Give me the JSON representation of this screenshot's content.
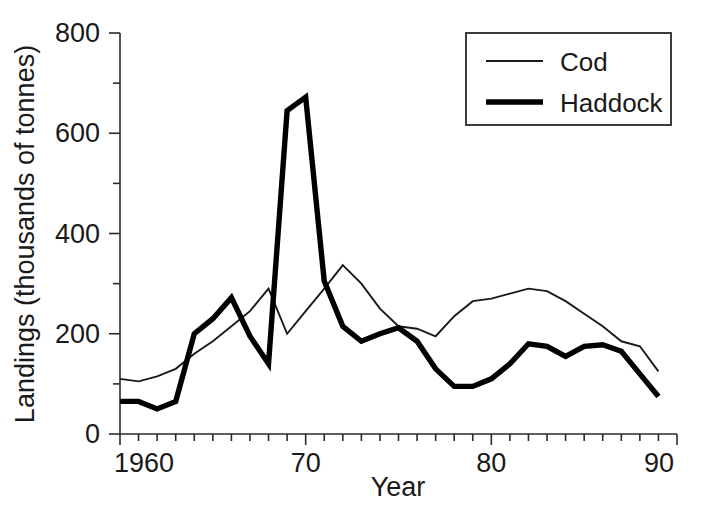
{
  "chart_data": {
    "type": "line",
    "title": "",
    "subtitle": "",
    "xlabel": "Year",
    "ylabel": "Landings (thousands of tonnes)",
    "xlim": [
      1960,
      1990
    ],
    "ylim": [
      0,
      800
    ],
    "grid": false,
    "legend_position": "top-right",
    "x_major_ticklabels": [
      "1960",
      "70",
      "80",
      "90"
    ],
    "x_major_tickvalues": [
      1960,
      1970,
      1980,
      1990
    ],
    "x_minor_tick_step": 1,
    "y_major_ticklabels": [
      "0",
      "200",
      "400",
      "600",
      "800"
    ],
    "y_major_tickvalues": [
      0,
      200,
      400,
      600,
      800
    ],
    "y_minor_tickvalues": [
      100,
      300,
      500,
      700
    ],
    "x": [
      1960,
      1961,
      1962,
      1963,
      1964,
      1965,
      1966,
      1967,
      1968,
      1969,
      1970,
      1971,
      1972,
      1973,
      1974,
      1975,
      1976,
      1977,
      1978,
      1979,
      1980,
      1981,
      1982,
      1983,
      1984,
      1985,
      1986,
      1987,
      1988,
      1989
    ],
    "series": [
      {
        "name": "Cod",
        "style": "thin",
        "color": "#1a1a1a",
        "values": [
          110,
          105,
          115,
          130,
          160,
          185,
          215,
          245,
          290,
          200,
          245,
          290,
          337,
          300,
          250,
          215,
          210,
          195,
          235,
          265,
          270,
          280,
          290,
          285,
          265,
          240,
          215,
          185,
          175,
          125
        ]
      },
      {
        "name": "Haddock",
        "style": "thick",
        "color": "#000000",
        "values": [
          65,
          65,
          50,
          65,
          200,
          230,
          272,
          195,
          140,
          645,
          672,
          305,
          215,
          185,
          200,
          212,
          185,
          130,
          95,
          95,
          110,
          140,
          180,
          175,
          155,
          175,
          178,
          165,
          120,
          75
        ]
      }
    ]
  },
  "legend": {
    "entries": [
      {
        "label": "Cod",
        "style": "thin"
      },
      {
        "label": "Haddock",
        "style": "thick"
      }
    ]
  },
  "axes": {
    "x_title": "Year",
    "y_title": "Landings (thousands of tonnes)"
  }
}
